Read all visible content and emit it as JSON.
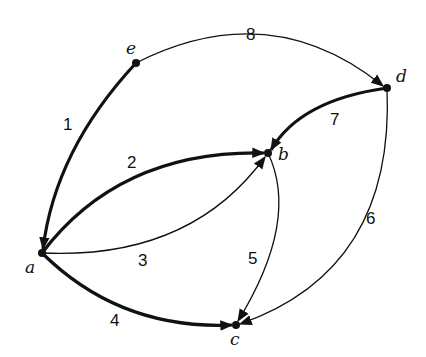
{
  "diagram": {
    "type": "directed-graph",
    "nodes": [
      {
        "id": "a",
        "label": "a"
      },
      {
        "id": "b",
        "label": "b"
      },
      {
        "id": "c",
        "label": "c"
      },
      {
        "id": "d",
        "label": "d"
      },
      {
        "id": "e",
        "label": "e"
      }
    ],
    "edges": [
      {
        "label": "1",
        "from": "e",
        "to": "a",
        "bold": true
      },
      {
        "label": "2",
        "from": "a",
        "to": "b",
        "bold": true
      },
      {
        "label": "3",
        "from": "a",
        "to": "b",
        "bold": false
      },
      {
        "label": "4",
        "from": "a",
        "to": "c",
        "bold": true
      },
      {
        "label": "5",
        "from": "b",
        "to": "c",
        "bold": false
      },
      {
        "label": "6",
        "from": "d",
        "to": "c",
        "bold": false
      },
      {
        "label": "7",
        "from": "d",
        "to": "b",
        "bold": true
      },
      {
        "label": "8",
        "from": "e",
        "to": "d",
        "bold": false
      }
    ]
  }
}
